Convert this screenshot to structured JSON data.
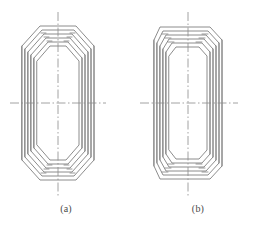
{
  "figure": {
    "type": "engineering-line-drawing",
    "background_color": "#ffffff",
    "line_color": "#6e6e6e",
    "centerline_color": "#8c8c8c",
    "panels": [
      {
        "id": "a",
        "caption": "(a)",
        "corner_style": "chamfered-pointed",
        "layer_count": 5,
        "outline_width": 84,
        "outline_height": 170
      },
      {
        "id": "b",
        "caption": "(b)",
        "corner_style": "rounded-flat",
        "layer_count": 5,
        "outline_width": 88,
        "outline_height": 172
      }
    ],
    "centerlines": {
      "vertical_label": "vertical-axis",
      "horizontal_label": "horizontal-axis",
      "style": "dash-dot"
    }
  }
}
